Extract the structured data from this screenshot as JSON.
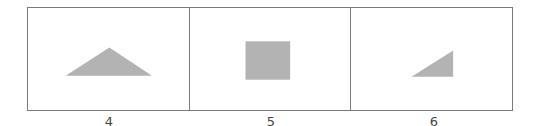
{
  "figure": {
    "colors": {
      "border": "#7a7a7a",
      "shape_fill": "#b3b3b3",
      "background": "#ffffff",
      "label": "#444444"
    },
    "panels": [
      {
        "label": "4",
        "shape": "isosceles-triangle",
        "points": "38,67 82,39 125,67"
      },
      {
        "label": "5",
        "shape": "rectangle",
        "x": 56,
        "y": 33,
        "width": 45,
        "height": 38
      },
      {
        "label": "6",
        "shape": "right-triangle",
        "points": "61,68 103,42 103,68"
      }
    ]
  }
}
